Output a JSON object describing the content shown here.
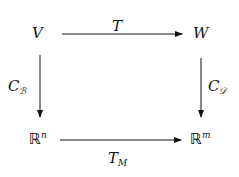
{
  "diagram": {
    "type": "commutative-diagram",
    "nodes": {
      "top_left": {
        "base": "V"
      },
      "top_right": {
        "base": "W"
      },
      "bottom_left": {
        "base": "ℝ",
        "sup": "n"
      },
      "bottom_right": {
        "base": "ℝ",
        "sup": "m"
      }
    },
    "arrows": {
      "top": {
        "label": "T",
        "from": "V",
        "to": "W"
      },
      "left": {
        "label_base": "C",
        "label_sub": "ℬ",
        "from": "V",
        "to": "ℝⁿ"
      },
      "right": {
        "label_base": "C",
        "label_sub": "𝒟",
        "from": "W",
        "to": "ℝᵐ"
      },
      "bottom": {
        "label_base": "T",
        "label_sub": "M",
        "from": "ℝⁿ",
        "to": "ℝᵐ"
      }
    },
    "colors": {
      "ink": "#111111",
      "background": "#ffffff"
    }
  }
}
